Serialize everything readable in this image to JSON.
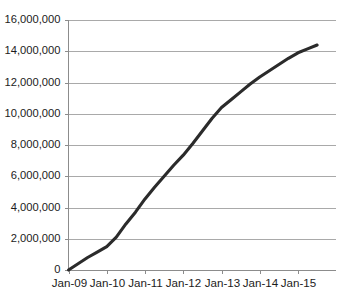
{
  "chart_data": {
    "type": "line",
    "title": "",
    "subtitle": "",
    "xlabel": "",
    "ylabel": "",
    "grid": true,
    "legend": false,
    "legend_position": "none",
    "line_color": "#2b2b2b",
    "gridline_color": "#a9a9a9",
    "axis_color": "#8c8c8c",
    "background_color": "#ffffff",
    "categories": [
      "Jan-09",
      "Jan-10",
      "Jan-11",
      "Jan-12",
      "Jan-13",
      "Jan-14",
      "Jan-15"
    ],
    "xtick_labels": [
      "Jan-09",
      "Jan-10",
      "Jan-11",
      "Jan-12",
      "Jan-13",
      "Jan-14",
      "Jan-15"
    ],
    "ytick_labels": [
      "16,000,000",
      "14,000,000",
      "12,000,000",
      "10,000,000",
      "8,000,000",
      "6,000,000",
      "4,000,000",
      "2,000,000",
      "0"
    ],
    "ytick_values": [
      16000000,
      14000000,
      12000000,
      10000000,
      8000000,
      6000000,
      4000000,
      2000000,
      0
    ],
    "ylim": [
      0,
      16000000
    ],
    "xlim": [
      "Jan-09",
      "Jan-15.5"
    ],
    "series": [
      {
        "name": "Cumulative total",
        "x": [
          "Jan-09",
          "Apr-09",
          "Jul-09",
          "Oct-09",
          "Jan-10",
          "Apr-10",
          "Jul-10",
          "Oct-10",
          "Jan-11",
          "Apr-11",
          "Jul-11",
          "Oct-11",
          "Jan-12",
          "Apr-12",
          "Jul-12",
          "Oct-12",
          "Jan-13",
          "Apr-13",
          "Jul-13",
          "Oct-13",
          "Jan-14",
          "Apr-14",
          "Jul-14",
          "Oct-14",
          "Jan-15",
          "Apr-15",
          "Jul-15"
        ],
        "values": [
          0,
          400000,
          800000,
          1150000,
          1500000,
          2100000,
          2950000,
          3700000,
          4550000,
          5300000,
          6000000,
          6700000,
          7350000,
          8100000,
          8900000,
          9700000,
          10400000,
          10900000,
          11400000,
          11900000,
          12350000,
          12750000,
          13150000,
          13550000,
          13900000,
          14150000,
          14400000
        ]
      }
    ],
    "annotations": [
      {
        "label": "start",
        "x": "Jan-09",
        "value": 0
      },
      {
        "label": "plateau",
        "x": "Jan-10",
        "value": 1500000
      },
      {
        "label": "slope-break",
        "x": "Jan-13",
        "value": 10400000
      },
      {
        "label": "end",
        "x": "Jul-15",
        "value": 14400000
      }
    ]
  }
}
